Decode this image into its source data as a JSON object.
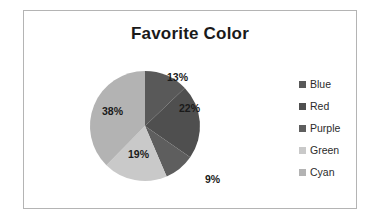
{
  "chart_data": {
    "type": "pie",
    "title": "Favorite Color",
    "xlabel": "",
    "ylabel": "",
    "legend_position": "right",
    "grid": false,
    "categories": [
      "Blue",
      "Red",
      "Purple",
      "Green",
      "Cyan"
    ],
    "values": [
      13,
      22,
      9,
      19,
      38
    ],
    "data_labels": [
      "13%",
      "22%",
      "9%",
      "19%",
      "38%"
    ],
    "slice_colors": [
      "#595959",
      "#4f4f4f",
      "#5e5e5e",
      "#c9c9c9",
      "#b3b3b3"
    ],
    "start_angle_deg": 0,
    "direction": "clockwise",
    "units": "percent"
  },
  "frame": {
    "border_color": "#b4b4b4",
    "background": "#ffffff"
  },
  "legend": {
    "items": [
      {
        "label": "Blue",
        "swatch": "#595959"
      },
      {
        "label": "Red",
        "swatch": "#4f4f4f"
      },
      {
        "label": "Purple",
        "swatch": "#5e5e5e"
      },
      {
        "label": "Green",
        "swatch": "#c9c9c9"
      },
      {
        "label": "Cyan",
        "swatch": "#b3b3b3"
      }
    ]
  }
}
